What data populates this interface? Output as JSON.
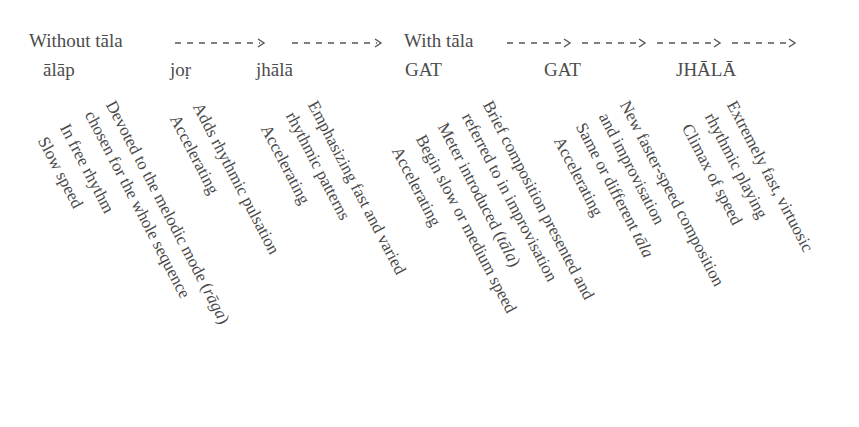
{
  "header": {
    "without_tala": "Without tāla",
    "with_tala": "With tāla"
  },
  "stages": [
    {
      "name": "ālāp"
    },
    {
      "name": "joṛ"
    },
    {
      "name": "jhālā"
    },
    {
      "name": "GAT"
    },
    {
      "name": "GAT"
    },
    {
      "name": "JHĀLĀ"
    }
  ],
  "descriptions": {
    "alap": [
      "Devoted to the melodic mode (rāga)",
      "chosen for the whole sequence",
      "In free rhythm",
      "Slow speed"
    ],
    "jor": [
      "Adds rhythmic pulsation",
      "Accelerating"
    ],
    "jhala": [
      "Emphasizing fast and varied",
      "rhythmic patterns",
      "Accelerating"
    ],
    "gat1": [
      "Brief composition presented and",
      "referred to in improvisation",
      "Meter introduced (tāla)",
      "Begin slow or medium speed",
      "Accelerating"
    ],
    "gat2": [
      "New faster-speed composition",
      "and improvisation",
      "Same or different tāla",
      "Accelerating"
    ],
    "jhala2": [
      "Extremely fast, virtuosic",
      "rhythmic playing",
      "Climax of speed"
    ]
  },
  "colors": {
    "text": "#4a4a4a",
    "arrow": "#555555",
    "background": "#ffffff"
  }
}
